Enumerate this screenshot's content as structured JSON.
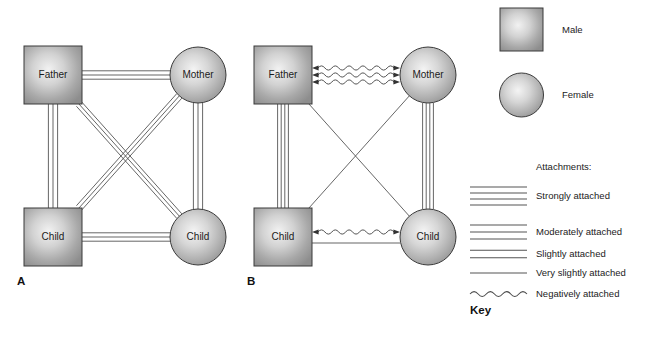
{
  "figure": {
    "type": "diagram",
    "background": "#ffffff",
    "panels": [
      {
        "letter": "A",
        "name": "panel-a",
        "description": "All family members strongly/moderately attached",
        "nodes": [
          {
            "id": "father",
            "label": "Father",
            "shape": "square",
            "position": "top-left"
          },
          {
            "id": "mother",
            "label": "Mother",
            "shape": "circle",
            "position": "top-right"
          },
          {
            "id": "child_left",
            "label": "Child",
            "shape": "square",
            "position": "bottom-left"
          },
          {
            "id": "child_right",
            "label": "Child",
            "shape": "circle",
            "position": "bottom-right"
          }
        ],
        "edges": [
          {
            "from": "father",
            "to": "mother",
            "style": "moderately-attached",
            "lines": 3
          },
          {
            "from": "father",
            "to": "child_left",
            "style": "moderately-attached",
            "lines": 3
          },
          {
            "from": "mother",
            "to": "child_right",
            "style": "moderately-attached",
            "lines": 3
          },
          {
            "from": "child_left",
            "to": "child_right",
            "style": "moderately-attached",
            "lines": 3
          },
          {
            "from": "father",
            "to": "child_right",
            "style": "moderately-attached",
            "lines": 3
          },
          {
            "from": "mother",
            "to": "child_left",
            "style": "moderately-attached",
            "lines": 3
          }
        ]
      },
      {
        "letter": "B",
        "name": "panel-b",
        "description": "Parents negatively attached; children mixed attachments",
        "nodes": [
          {
            "id": "father",
            "label": "Father",
            "shape": "square",
            "position": "top-left"
          },
          {
            "id": "mother",
            "label": "Mother",
            "shape": "circle",
            "position": "top-right"
          },
          {
            "id": "child_left",
            "label": "Child",
            "shape": "square",
            "position": "bottom-left"
          },
          {
            "id": "child_right",
            "label": "Child",
            "shape": "circle",
            "position": "bottom-right"
          }
        ],
        "edges": [
          {
            "from": "father",
            "to": "mother",
            "style": "negatively-attached",
            "lines": 3,
            "arrows": "both"
          },
          {
            "from": "father",
            "to": "child_left",
            "style": "strongly-attached",
            "lines": 4
          },
          {
            "from": "mother",
            "to": "child_right",
            "style": "strongly-attached",
            "lines": 4
          },
          {
            "from": "child_left",
            "to": "child_right",
            "style": "negatively-attached",
            "lines": 1,
            "arrows": "both"
          },
          {
            "from": "child_left",
            "to": "child_right",
            "style": "very-slightly-attached",
            "lines": 1
          },
          {
            "from": "father",
            "to": "child_right",
            "style": "very-slightly-attached",
            "lines": 1
          },
          {
            "from": "mother",
            "to": "child_left",
            "style": "very-slightly-attached",
            "lines": 1
          }
        ]
      }
    ]
  },
  "legend": {
    "name": "key",
    "key_label": "Key",
    "shapes": [
      {
        "id": "male",
        "label": "Male",
        "shape": "square"
      },
      {
        "id": "female",
        "label": "Female",
        "shape": "circle"
      }
    ],
    "attachments_title": "Attachments:",
    "attachments": [
      {
        "id": "strongly",
        "label": "Strongly attached",
        "lines": 4,
        "style": "straight"
      },
      {
        "id": "moderately",
        "label": "Moderately attached",
        "lines": 3,
        "style": "straight"
      },
      {
        "id": "slightly",
        "label": "Slightly attached",
        "lines": 2,
        "style": "straight"
      },
      {
        "id": "very_slightly",
        "label": "Very slightly attached",
        "lines": 1,
        "style": "straight"
      },
      {
        "id": "negatively",
        "label": "Negatively attached",
        "lines": 1,
        "style": "wavy"
      }
    ]
  },
  "colors": {
    "line": "#4a4a4a",
    "node_stroke": "#3a3a3a",
    "node_center": "#e8e8e8",
    "node_edge": "#8a8a8a",
    "text": "#1b1b1b"
  }
}
